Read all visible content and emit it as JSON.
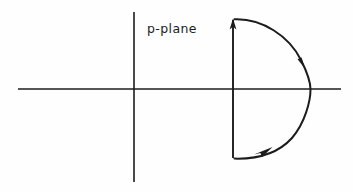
{
  "figure": {
    "title_label": "p-plane",
    "background_color": "#fefefe",
    "ink_color": "#1c1c1c",
    "canvas": {
      "width": 353,
      "height": 192
    },
    "label": {
      "text": "p-plane",
      "x": 147,
      "y": 33
    },
    "axes": {
      "real_axis": {
        "name": "horizontal-axis",
        "x1": 18,
        "y1": 89,
        "x2": 341,
        "y2": 89,
        "stroke_width": 1.6
      },
      "imaginary_axis": {
        "name": "vertical-axis",
        "x1": 134,
        "y1": 12,
        "x2": 134,
        "y2": 182,
        "stroke_width": 1.6
      },
      "origin": {
        "x": 134,
        "y": 89
      }
    },
    "contour": {
      "name": "closed-contour",
      "direction": "counterclockwise-upward-then-clockwise-arc",
      "vertical_segment": {
        "name": "bromwich-vertical-line",
        "x": 233,
        "y_bottom": 158,
        "y_top": 20,
        "stroke_width": 1.9
      },
      "arc": {
        "name": "semicircular-arc",
        "center_x": 233,
        "center_y": 89,
        "radius": 76,
        "start_x": 235,
        "start_y": 19,
        "end_x": 235,
        "end_y": 158,
        "rightmost_x": 310,
        "stroke_width": 1.9
      },
      "arrowheads": [
        {
          "name": "arrowhead-up-on-vertical",
          "x": 233,
          "y": 22,
          "angle_deg": -90
        },
        {
          "name": "arrowhead-on-arc-right",
          "x": 302,
          "y": 60,
          "angle_deg": 65
        },
        {
          "name": "arrowhead-on-arc-bottom",
          "x": 266,
          "y": 152,
          "angle_deg": -27
        }
      ]
    }
  },
  "chart_data": {
    "type": "line",
    "title": "p-plane",
    "xlabel": "",
    "ylabel": "",
    "grid": false,
    "legend": "none",
    "annotations": [
      "p-plane"
    ],
    "series": [
      {
        "name": "real-axis",
        "x": [
          18,
          341
        ],
        "y": [
          89,
          89
        ]
      },
      {
        "name": "imaginary-axis",
        "x": [
          134,
          134
        ],
        "y": [
          12,
          182
        ]
      },
      {
        "name": "contour-vertical",
        "x": [
          233,
          233
        ],
        "y": [
          158,
          20
        ]
      },
      {
        "name": "contour-arc",
        "x": [
          235,
          285,
          310,
          285,
          235
        ],
        "y": [
          19,
          33,
          89,
          145,
          158
        ]
      }
    ]
  }
}
